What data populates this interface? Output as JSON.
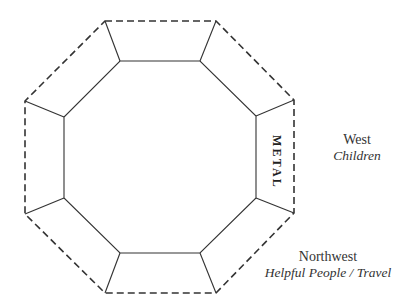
{
  "diagram": {
    "shape": "octagon-frame",
    "stroke_color": "#333333",
    "outer_border_style": "dashed",
    "inner_border_style": "solid",
    "segment_label": "METAL",
    "segment_position": "right"
  },
  "labels": {
    "west": {
      "direction": "West",
      "meaning": "Children"
    },
    "northwest": {
      "direction": "Northwest",
      "meaning": "Helpful People / Travel"
    }
  }
}
